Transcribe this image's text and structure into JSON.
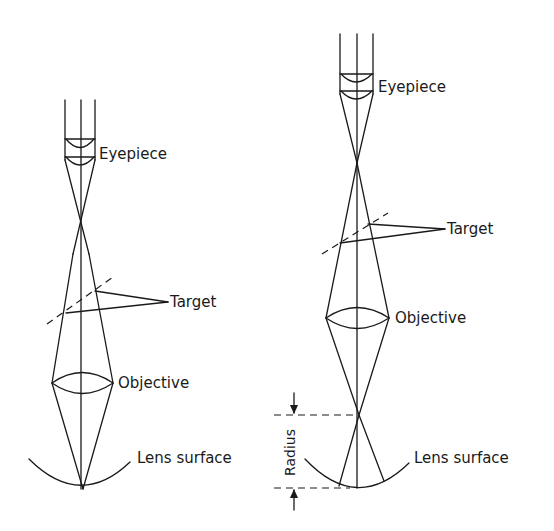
{
  "figure": {
    "left_diagram": {
      "labels": {
        "eyepiece": "Eyepiece",
        "target": "Target",
        "objective": "Objective",
        "lens_surface": "Lens surface"
      }
    },
    "right_diagram": {
      "labels": {
        "eyepiece": "Eyepiece",
        "target": "Target",
        "objective": "Objective",
        "lens_surface": "Lens surface",
        "radius": "Radius"
      }
    },
    "colors": {
      "ink": "#1a1a1a",
      "background": "#ffffff"
    }
  }
}
